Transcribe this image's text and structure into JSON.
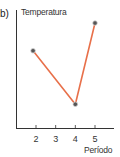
{
  "panel": {
    "label": "b)"
  },
  "chart_data": {
    "type": "line",
    "title": "",
    "xlabel": "Período",
    "ylabel": "Temperatura",
    "x_ticks": [
      2,
      3,
      4,
      5
    ],
    "x": [
      1.85,
      4,
      5
    ],
    "values": [
      3.9,
      1.2,
      5.3
    ],
    "series": [
      {
        "name": "Temperatura",
        "x": [
          1.85,
          4,
          5
        ],
        "values": [
          3.9,
          1.2,
          5.3
        ],
        "color": "#e8704a"
      }
    ],
    "y_ticks": [],
    "grid": false,
    "legend": "none",
    "xlim": [
      1,
      6.2
    ],
    "ylim": [
      0,
      6
    ]
  },
  "colors": {
    "line": "#e8704a",
    "marker": "#555555",
    "axis": "#333333"
  }
}
